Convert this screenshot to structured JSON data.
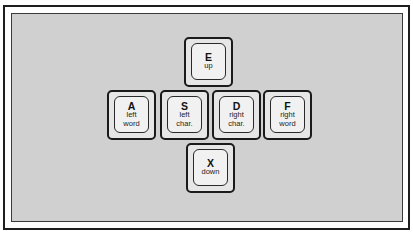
{
  "diagram": {
    "title": "",
    "keys": [
      {
        "id": "E",
        "letter": "E",
        "lines": [
          "up"
        ],
        "x": 184,
        "y": 37
      },
      {
        "id": "A",
        "letter": "A",
        "lines": [
          "left",
          "word"
        ],
        "x": 107,
        "y": 90
      },
      {
        "id": "S",
        "letter": "S",
        "lines": [
          "left",
          "char."
        ],
        "x": 160,
        "y": 90
      },
      {
        "id": "D",
        "letter": "D",
        "lines": [
          "right",
          "char."
        ],
        "x": 212,
        "y": 90
      },
      {
        "id": "F",
        "letter": "F",
        "lines": [
          "right",
          "word"
        ],
        "x": 263,
        "y": 90
      },
      {
        "id": "X",
        "letter": "X",
        "lines": [
          "down"
        ],
        "x": 186,
        "y": 143
      }
    ],
    "colors": {
      "panel_background": "#d0d0d0",
      "key_face": "#f1f1f1",
      "key_border": "#1a1a1a"
    }
  }
}
